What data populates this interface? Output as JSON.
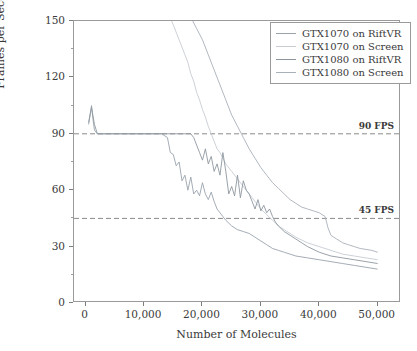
{
  "chart_data": {
    "type": "line",
    "title": "",
    "xlabel": "Number of Molecules",
    "ylabel": "Frames per Second (fps)",
    "xlim": [
      -2000,
      54000
    ],
    "ylim": [
      0,
      150
    ],
    "xticks": [
      0,
      10000,
      20000,
      30000,
      40000,
      50000
    ],
    "xticklabels": [
      "0",
      "10,000",
      "20,000",
      "30,000",
      "40,000",
      "50,000"
    ],
    "yticks": [
      0,
      30,
      60,
      90,
      120,
      150
    ],
    "yticklabels": [
      "0",
      "30",
      "60",
      "90",
      "120",
      "150"
    ],
    "yminorticks": [
      15,
      45,
      75,
      105,
      135
    ],
    "grid": false,
    "legend_position": "upper right",
    "annotations": [
      {
        "name": "90-fps-threshold",
        "label": "90 FPS",
        "y": 90,
        "style": "dashed"
      },
      {
        "name": "45-fps-threshold",
        "label": "45 FPS",
        "y": 45,
        "style": "dashed"
      }
    ],
    "series": [
      {
        "name": "GTX1070 on RiftVR",
        "color": "#9aa3ad",
        "x": [
          500,
          1000,
          1200,
          1500,
          2000,
          2500,
          3000,
          5000,
          8000,
          11000,
          13000,
          14000,
          14500,
          15000,
          15500,
          16000,
          16500,
          17000,
          17500,
          18000,
          18500,
          19000,
          19500,
          20000,
          20500,
          21000,
          21500,
          22000,
          22500,
          23000,
          23500,
          24000,
          25000,
          26000,
          27000,
          28000,
          29000,
          30000,
          31000,
          32000,
          33000,
          34000,
          35000,
          36000,
          38000,
          40000,
          42000,
          44000,
          46000,
          48000,
          50000
        ],
        "y": [
          95,
          105,
          99,
          92,
          90,
          90,
          90,
          90,
          90,
          90,
          90,
          88,
          80,
          79,
          73,
          75,
          65,
          68,
          60,
          67,
          58,
          60,
          57,
          64,
          58,
          55,
          59,
          54,
          50,
          48,
          46,
          44,
          41,
          39,
          38,
          37,
          35,
          33,
          31,
          29,
          28,
          27,
          26,
          25,
          24,
          23,
          22,
          21,
          20,
          19,
          18
        ]
      },
      {
        "name": "GTX1070 on Screen",
        "color": "#c6ccd2",
        "x": [
          0,
          2000,
          5000,
          8000,
          11000,
          13000,
          14000,
          15000,
          16000,
          17000,
          17500,
          18000,
          18500,
          19000,
          19500,
          20000,
          20500,
          21000,
          21500,
          22000,
          22500,
          23000,
          24000,
          25000,
          26000,
          27000,
          28000,
          29000,
          30000,
          31000,
          32000,
          33000,
          34000,
          35000,
          36000,
          38000,
          40000,
          42000,
          44000,
          46000,
          48000,
          50000
        ],
        "y": [
          220,
          205,
          190,
          178,
          168,
          160,
          155,
          148,
          140,
          132,
          128,
          122,
          118,
          112,
          108,
          103,
          99,
          94,
          90,
          86,
          82,
          80,
          74,
          70,
          66,
          62,
          58,
          54,
          50,
          47,
          44,
          41,
          39,
          37,
          35,
          32,
          30,
          28,
          26,
          25,
          24,
          23
        ]
      },
      {
        "name": "GTX1080 on RiftVR",
        "color": "#8e979f",
        "x": [
          500,
          1000,
          1500,
          2000,
          3000,
          6000,
          9000,
          12000,
          15000,
          17000,
          18000,
          18500,
          19000,
          19500,
          20000,
          20500,
          21000,
          21500,
          22000,
          22500,
          23000,
          23500,
          24000,
          24500,
          25000,
          25500,
          26000,
          26500,
          27000,
          27500,
          28000,
          28500,
          29000,
          29500,
          30000,
          30500,
          31000,
          31500,
          32000,
          32500,
          33000,
          34000,
          35000,
          36000,
          37000,
          38000,
          40000,
          42000,
          44000,
          46000,
          48000,
          50000
        ],
        "y": [
          96,
          104,
          95,
          90,
          90,
          90,
          90,
          90,
          90,
          90,
          90,
          88,
          84,
          80,
          76,
          82,
          74,
          78,
          70,
          74,
          68,
          80,
          70,
          58,
          62,
          57,
          68,
          56,
          65,
          60,
          58,
          54,
          50,
          55,
          49,
          52,
          48,
          50,
          46,
          43,
          41,
          38,
          36,
          34,
          32,
          30,
          27,
          25,
          24,
          23,
          22,
          21
        ]
      },
      {
        "name": "GTX1080 on Screen",
        "color": "#a8b0b8",
        "x": [
          0,
          3000,
          6000,
          9000,
          12000,
          15000,
          18000,
          19000,
          20000,
          21000,
          22000,
          23000,
          24000,
          25000,
          26000,
          27000,
          28000,
          29000,
          30000,
          31000,
          32000,
          33000,
          34000,
          35000,
          36000,
          37000,
          38000,
          39000,
          40000,
          41000,
          41500,
          42000,
          43000,
          44000,
          45000,
          46000,
          47000,
          48000,
          49000,
          50000
        ],
        "y": [
          250,
          232,
          214,
          196,
          180,
          166,
          152,
          146,
          140,
          132,
          124,
          116,
          108,
          100,
          94,
          88,
          82,
          77,
          72,
          68,
          64,
          61,
          58,
          55,
          53,
          51,
          50,
          49,
          48,
          46,
          40,
          36,
          34,
          32,
          31,
          30,
          29,
          28.5,
          28,
          27
        ]
      }
    ]
  },
  "legend": {
    "items": [
      {
        "label": "GTX1070 on RiftVR",
        "color": "#9aa3ad"
      },
      {
        "label": "GTX1070 on Screen",
        "color": "#c6ccd2"
      },
      {
        "label": "GTX1080 on RiftVR",
        "color": "#8e979f"
      },
      {
        "label": "GTX1080 on Screen",
        "color": "#a8b0b8"
      }
    ]
  },
  "style": {
    "axis_color": "#9a9a9a",
    "text_color": "#3a3a3a",
    "threshold_color": "#8a8a8a",
    "background": "#ffffff"
  }
}
